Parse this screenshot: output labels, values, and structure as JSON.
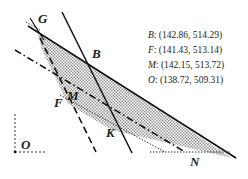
{
  "diagram": {
    "points": {
      "G": {
        "label": "G"
      },
      "B": {
        "label": "B"
      },
      "M": {
        "label": "M"
      },
      "F": {
        "label": "F"
      },
      "K": {
        "label": "K"
      },
      "N": {
        "label": "N"
      },
      "O": {
        "label": "O"
      }
    },
    "coordinates": [
      {
        "point": "B",
        "sep": ":",
        "value": "(142.86, 514.29)"
      },
      {
        "point": "F",
        "sep": ":",
        "value": "(141.43, 513.14)"
      },
      {
        "point": "M",
        "sep": ":",
        "value": "(142.15, 513.72)"
      },
      {
        "point": "O",
        "sep": ":",
        "value": "(138.72, 509.31)"
      }
    ],
    "colors": {
      "line": "#111111",
      "hatch": "#8a8a8a"
    }
  }
}
